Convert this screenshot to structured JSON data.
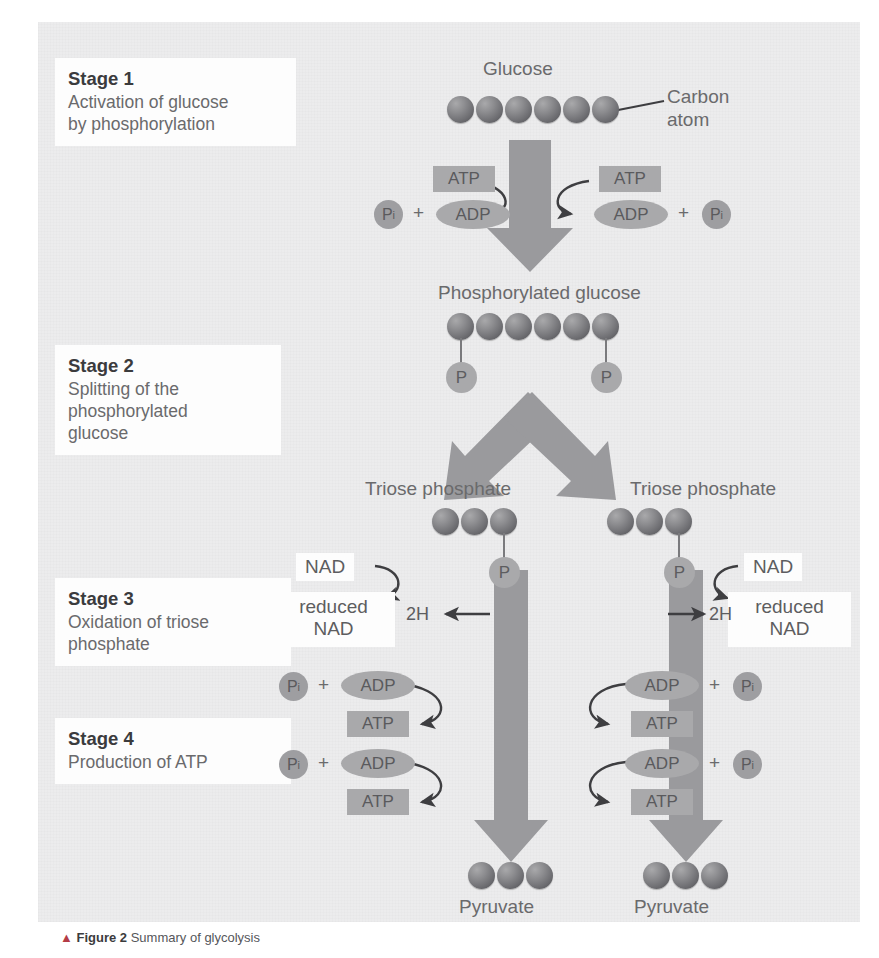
{
  "diagram": {
    "background_color": "#ececed",
    "arrow_color": "#9a9a9d",
    "carbon_color": "#6f6f73",
    "phosphate_color": "#a9a9ab"
  },
  "stages": [
    {
      "title": "Stage 1",
      "desc": "Activation of glucose\nby phosphorylation"
    },
    {
      "title": "Stage 2",
      "desc": "Splitting of the\nphosphorylated\nglucose"
    },
    {
      "title": "Stage 3",
      "desc": "Oxidation of triose\nphosphate"
    },
    {
      "title": "Stage 4",
      "desc": "Production of ATP"
    }
  ],
  "molecules": {
    "glucose": {
      "label": "Glucose",
      "carbon_count": 6,
      "phosphates": 0
    },
    "phosphorylated_glucose": {
      "label": "Phosphorylated glucose",
      "carbon_count": 6,
      "phosphates": 2
    },
    "triose_phosphate_left": {
      "label": "Triose phosphate",
      "carbon_count": 3,
      "phosphates": 1
    },
    "triose_phosphate_right": {
      "label": "Triose phosphate",
      "carbon_count": 3,
      "phosphates": 1
    },
    "pyruvate_left": {
      "label": "Pyruvate",
      "carbon_count": 3
    },
    "pyruvate_right": {
      "label": "Pyruvate",
      "carbon_count": 3
    }
  },
  "annotations": {
    "carbon_atom": "Carbon\natom",
    "phosphate_symbol": "P"
  },
  "labels": {
    "atp": "ATP",
    "adp": "ADP",
    "pi": "P",
    "pi_subscript": "i",
    "plus": "+",
    "nad": "NAD",
    "reduced_nad": "reduced\nNAD",
    "two_h": "2H"
  },
  "stage1_reactions": [
    {
      "side": "left",
      "consumed": "ATP",
      "produced": "ADP",
      "plus": "+",
      "pi": "P"
    },
    {
      "side": "right",
      "consumed": "ATP",
      "produced": "ADP",
      "plus": "+",
      "pi": "P"
    }
  ],
  "stage3_reactions": [
    {
      "side": "left",
      "oxidant": "NAD",
      "product": "reduced\nNAD",
      "hydrogen": "2H"
    },
    {
      "side": "right",
      "oxidant": "NAD",
      "product": "reduced\nNAD",
      "hydrogen": "2H"
    }
  ],
  "stage4_reactions": [
    {
      "side": "left",
      "index": 1,
      "substrate": "ADP",
      "pi": "P",
      "plus": "+",
      "product": "ATP"
    },
    {
      "side": "left",
      "index": 2,
      "substrate": "ADP",
      "pi": "P",
      "plus": "+",
      "product": "ATP"
    },
    {
      "side": "right",
      "index": 1,
      "substrate": "ADP",
      "pi": "P",
      "plus": "+",
      "product": "ATP"
    },
    {
      "side": "right",
      "index": 2,
      "substrate": "ADP",
      "pi": "P",
      "plus": "+",
      "product": "ATP"
    }
  ],
  "caption": {
    "marker": "▲",
    "figure": "Figure 2",
    "text": "Summary of glycolysis"
  }
}
